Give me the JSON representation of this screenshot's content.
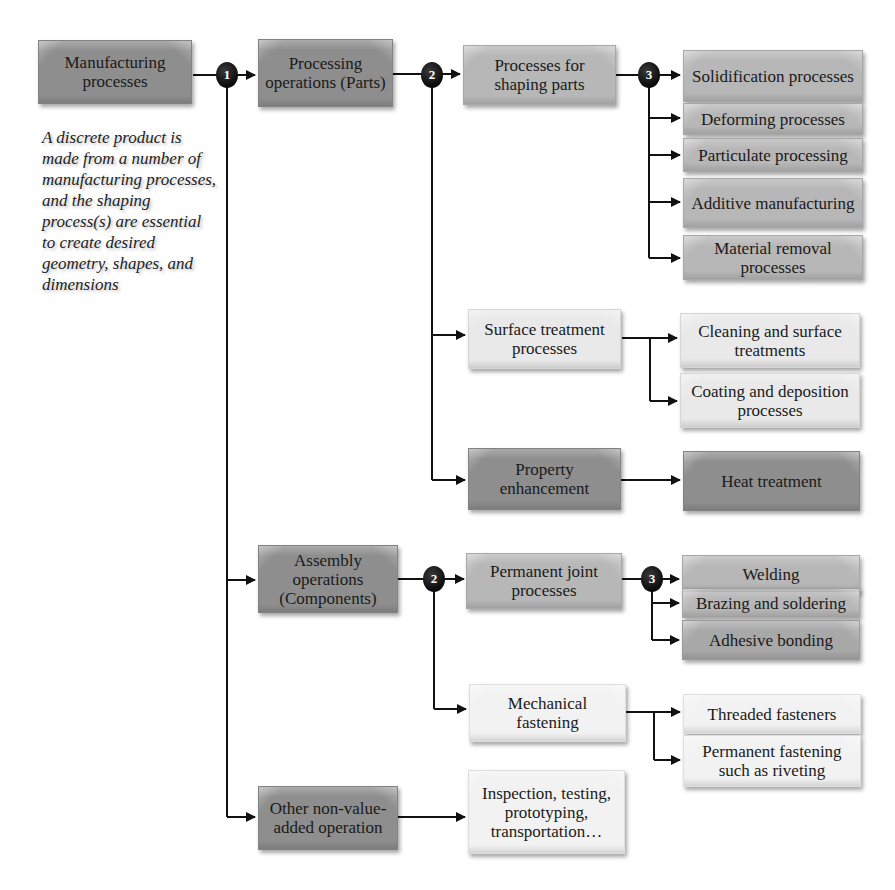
{
  "header": {
    "clipped_text": ""
  },
  "root": {
    "label": "Manufacturing processes"
  },
  "note": "A discrete product is made from a number of manufacturing processes, and the shaping process(s) are essential to create desired geometry, shapes, and dimensions",
  "badges": {
    "level1": "1",
    "level2": "2",
    "level3": "3"
  },
  "level1": {
    "processing": "Processing operations (Parts)",
    "assembly": "Assembly operations (Components)",
    "other": "Other non-value-added operation"
  },
  "level2": {
    "shaping": "Processes for shaping parts",
    "surface": "Surface treatment processes",
    "property": "Property enhancement",
    "permanent": "Permanent joint processes",
    "mechanical": "Mechanical fastening",
    "inspection": "Inspection, testing, prototyping, transportation…"
  },
  "level3": {
    "shaping": [
      "Solidification processes",
      "Deforming processes",
      "Particulate processing",
      "Additive manufacturing",
      "Material removal processes"
    ],
    "surface": [
      "Cleaning and surface treatments",
      "Coating and deposition processes"
    ],
    "property": [
      "Heat treatment"
    ],
    "permanent": [
      "Welding",
      "Brazing and soldering",
      "Adhesive bonding"
    ],
    "mechanical": [
      "Threaded fasteners",
      "Permanent fastening such as riveting"
    ]
  },
  "colors": {
    "dark": "#8e8e8e",
    "mid": "#b7b7b7",
    "light": "#e9e9e9",
    "line": "#111111"
  }
}
